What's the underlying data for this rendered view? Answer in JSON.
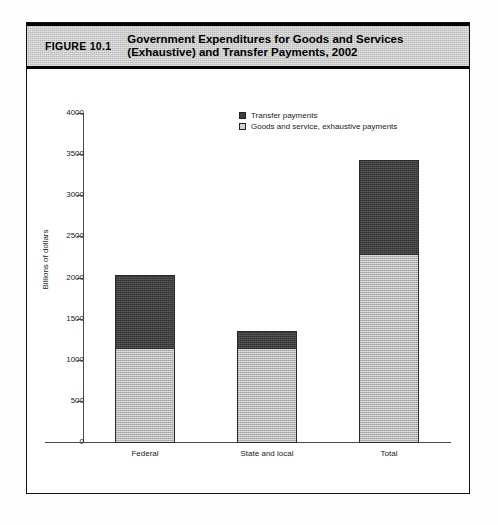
{
  "figure": {
    "number_label": "FIGURE 10.1",
    "title": "Government Expenditures for Goods and Services\n(Exhaustive) and Transfer Payments, 2002"
  },
  "legend": {
    "position": "top-right",
    "items": [
      {
        "label": "Transfer payments",
        "swatch": "dark",
        "color": "#3e3e3e"
      },
      {
        "label": "Goods and service, exhaustive payments",
        "swatch": "light",
        "color": "#b8b8b8"
      }
    ]
  },
  "chart_data": {
    "type": "bar",
    "stacked": true,
    "title": "Government Expenditures for Goods and Services (Exhaustive) and Transfer Payments, 2002",
    "xlabel": "",
    "ylabel": "Billions of dollars",
    "ylim": [
      0,
      4000
    ],
    "ytick_step": 500,
    "yticks": [
      4000,
      3500,
      3000,
      2500,
      2000,
      1500,
      1000,
      500,
      0
    ],
    "ytick_labels": [
      "4000",
      "3500",
      "3000",
      "2500",
      "2000",
      "1500",
      "1000",
      "500",
      "0"
    ],
    "grid": false,
    "categories": [
      "Federal",
      "State and local",
      "Total"
    ],
    "series": [
      {
        "name": "Goods and service, exhaustive payments",
        "color": "#b8b8b8",
        "values": [
          1150,
          1150,
          2300
        ]
      },
      {
        "name": "Transfer payments",
        "color": "#3e3e3e",
        "values": [
          900,
          225,
          1150
        ]
      }
    ],
    "totals": [
      2050,
      1375,
      3450
    ]
  },
  "colors": {
    "header_band": "#b9b9b9",
    "frame": "#111111",
    "dark_fill": "#3e3e3e",
    "light_fill": "#b8b8b8",
    "axis": "#4a4a4a"
  }
}
